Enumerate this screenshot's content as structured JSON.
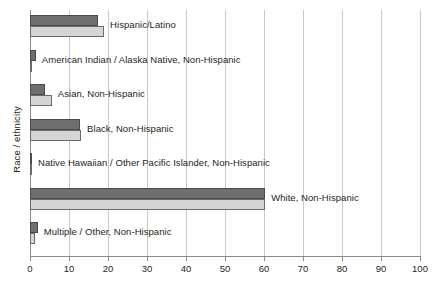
{
  "chart_data": {
    "type": "bar",
    "orientation": "horizontal",
    "title": "",
    "xlabel": "",
    "ylabel": "Race / ethnicity",
    "xlim": [
      0,
      100
    ],
    "xticks": [
      0,
      10,
      20,
      30,
      40,
      50,
      60,
      70,
      80,
      90,
      100
    ],
    "grid": true,
    "legend": "none",
    "categories": [
      "Hispanic/Latino",
      "American Indian / Alaska Native, Non-Hispanic",
      "Asian, Non-Hispanic",
      "Black, Non-Hispanic",
      "Native Hawaiian / Other Pacific Islander, Non-Hispanic",
      "White, Non-Hispanic",
      "Multiple / Other, Non-Hispanic"
    ],
    "series": [
      {
        "name": "Series 1",
        "color": "#6f6f6f",
        "values": [
          17.4,
          1.5,
          3.8,
          12.8,
          0.4,
          60.3,
          2.0
        ]
      },
      {
        "name": "Series 2",
        "color": "#d5d5d5",
        "values": [
          19.0,
          0.6,
          5.6,
          13.1,
          0.3,
          60.3,
          1.3
        ]
      }
    ]
  },
  "colors": {
    "series_dark": "#6f6f6f",
    "series_light": "#d5d5d5",
    "gridline": "#c9c9c9",
    "axis": "#8c8c8c",
    "text": "#231f20",
    "background": "#ffffff"
  }
}
